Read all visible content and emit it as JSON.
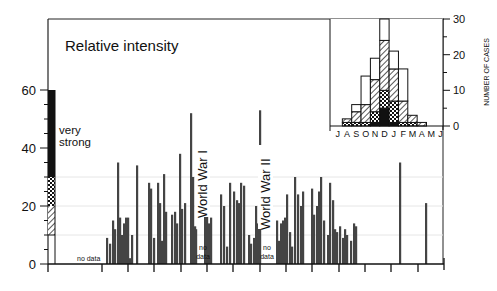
{
  "chart_data": [
    {
      "type": "bar",
      "title": "Relative intensity",
      "xlabel": "",
      "ylabel": "",
      "ylim": [
        0,
        60
      ],
      "yticks": [
        0,
        20,
        40,
        60
      ],
      "grid": true,
      "legend_scale": {
        "label": "very strong",
        "bands": [
          {
            "name": "very strong",
            "from": 30,
            "to": 60,
            "pattern": "solid"
          },
          {
            "name": "strong",
            "from": 20,
            "to": 30,
            "pattern": "crosshatch"
          },
          {
            "name": "moderate",
            "from": 10,
            "to": 20,
            "pattern": "diagonal"
          },
          {
            "name": "weak",
            "from": 0,
            "to": 10,
            "pattern": "none"
          }
        ]
      },
      "annotations": [
        "no data",
        "World War I",
        "no data",
        "World War II",
        "no data"
      ],
      "x_px": [
        106,
        109,
        112,
        114,
        117,
        119,
        121,
        123,
        125,
        127,
        129,
        131,
        136,
        148,
        150,
        153,
        157,
        159,
        161,
        163,
        165,
        171,
        174,
        176,
        179,
        181,
        184,
        190,
        192,
        194,
        195,
        204,
        206,
        208,
        210,
        220,
        223,
        226,
        229,
        233,
        236,
        238,
        240,
        243,
        248,
        250,
        253,
        255,
        257,
        259,
        276,
        278,
        280,
        282,
        284,
        286,
        289,
        291,
        294,
        297,
        300,
        302,
        311,
        313,
        316,
        318,
        320,
        323,
        327,
        329,
        332,
        334,
        336,
        339,
        342,
        344,
        346,
        350,
        353,
        355,
        399,
        425
      ],
      "values": [
        9,
        7,
        15,
        12,
        35,
        16,
        10,
        14,
        16,
        16,
        2,
        10,
        34,
        28,
        26,
        9,
        28,
        21,
        8,
        31,
        18,
        17,
        18,
        14,
        38,
        19,
        21,
        52,
        30,
        13,
        12,
        24,
        25,
        14,
        16,
        24,
        20,
        6,
        28,
        25,
        22,
        21,
        28,
        27,
        10,
        7,
        9,
        20,
        14,
        53,
        15,
        8,
        14,
        15,
        16,
        24,
        11,
        6,
        30,
        24,
        20,
        25,
        26,
        17,
        20,
        25,
        30,
        15,
        10,
        28,
        22,
        12,
        11,
        13,
        9,
        12,
        10,
        8,
        14,
        13,
        35,
        21
      ]
    },
    {
      "type": "bar",
      "stacked": true,
      "title": "",
      "xlabel": "",
      "ylabel": "NUMBER OF CASES",
      "ylim": [
        0,
        30
      ],
      "yticks": [
        0,
        10,
        20,
        30
      ],
      "categories": [
        "J",
        "A",
        "S",
        "O",
        "N",
        "D",
        "J",
        "F",
        "M",
        "A",
        "M",
        "J"
      ],
      "series": [
        {
          "name": "very strong (solid)",
          "values": [
            0,
            0,
            0,
            0,
            1,
            5,
            1,
            0,
            0,
            0,
            0,
            0
          ]
        },
        {
          "name": "strong (crosshatch)",
          "values": [
            0,
            1,
            1,
            1,
            3,
            5,
            6,
            1,
            1,
            0,
            0,
            0
          ]
        },
        {
          "name": "moderate (diagonal)",
          "values": [
            0,
            1,
            3,
            5,
            9,
            14,
            9,
            6,
            2,
            1,
            0,
            0
          ]
        },
        {
          "name": "weak (open)",
          "values": [
            0,
            0,
            2,
            8,
            6,
            6,
            5,
            9,
            0,
            0,
            0,
            0
          ]
        }
      ],
      "totals": [
        0,
        2,
        6,
        14,
        19,
        30,
        21,
        16,
        3,
        1,
        0,
        0
      ]
    }
  ],
  "labels": {
    "title": "Relative intensity",
    "very": "very",
    "strong": "strong",
    "no_data_1": "no data",
    "no_data_2a": "no",
    "no_data_2b": "data",
    "no_data_3a": "no",
    "no_data_3b": "data",
    "ww1": "World War I",
    "ww2": "World War II",
    "y60": "60",
    "y40": "40",
    "y20": "20",
    "y0": "0",
    "inset_ylabel": "NUMBER OF CASES",
    "i30": "30",
    "i20": "20",
    "i10": "10",
    "i0": "0",
    "months": [
      "J",
      "A",
      "S",
      "O",
      "N",
      "D",
      "J",
      "F",
      "M",
      "A",
      "M",
      "J"
    ]
  }
}
